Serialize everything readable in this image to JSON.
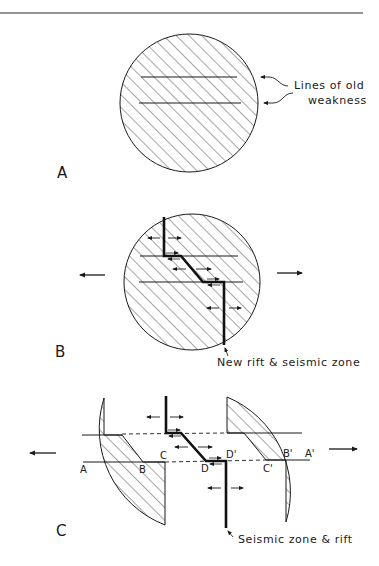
{
  "figure": {
    "type": "diagram",
    "colors": {
      "ink": "#1a1a1a",
      "background": "#ffffff",
      "hatch": "#3a3a3a"
    }
  },
  "panels": [
    {
      "id": "A",
      "label": "A",
      "annotation": {
        "line1": "Lines of old",
        "line2": "weakness"
      }
    },
    {
      "id": "B",
      "label": "B",
      "annotation": "New rift & seismic zone",
      "arrows": [
        "extension-left",
        "extension-right"
      ]
    },
    {
      "id": "C",
      "label": "C",
      "annotation": "Seismic zone & rift",
      "points": {
        "A": "A",
        "B": "B",
        "C": "C",
        "D": "D",
        "A_prime": "A'",
        "B_prime": "B'",
        "C_prime": "C'",
        "D_prime": "D'"
      },
      "arrows": [
        "extension-left",
        "extension-right"
      ]
    }
  ]
}
